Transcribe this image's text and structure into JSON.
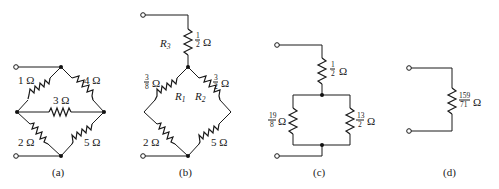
{
  "figure": {
    "panels": [
      {
        "id": "a",
        "caption": "(a)",
        "resistors": [
          {
            "name": "",
            "value": "1 Ω",
            "position": "upper-left"
          },
          {
            "name": "",
            "value": "4 Ω",
            "position": "upper-right"
          },
          {
            "name": "",
            "value": "3 Ω",
            "position": "center-bridge"
          },
          {
            "name": "",
            "value": "2 Ω",
            "position": "lower-left"
          },
          {
            "name": "",
            "value": "5 Ω",
            "position": "lower-right"
          }
        ]
      },
      {
        "id": "b",
        "caption": "(b)",
        "resistors": [
          {
            "name": "R",
            "sub": "3",
            "num": "1",
            "den": "2",
            "unit": "Ω",
            "position": "series-top"
          },
          {
            "name": "R",
            "sub": "1",
            "num": "3",
            "den": "8",
            "unit": "Ω",
            "position": "upper-left"
          },
          {
            "name": "R",
            "sub": "2",
            "num": "3",
            "den": "2",
            "unit": "Ω",
            "position": "upper-right"
          },
          {
            "name": "",
            "value": "2 Ω",
            "position": "lower-left"
          },
          {
            "name": "",
            "value": "5 Ω",
            "position": "lower-right"
          }
        ]
      },
      {
        "id": "c",
        "caption": "(c)",
        "resistors": [
          {
            "num": "1",
            "den": "2",
            "unit": "Ω",
            "position": "series-top"
          },
          {
            "num": "19",
            "den": "8",
            "unit": "Ω",
            "position": "parallel-left"
          },
          {
            "num": "13",
            "den": "2",
            "unit": "Ω",
            "position": "parallel-right"
          }
        ]
      },
      {
        "id": "d",
        "caption": "(d)",
        "resistors": [
          {
            "num": "159",
            "den": "71",
            "unit": "Ω",
            "position": "single"
          }
        ]
      }
    ]
  }
}
